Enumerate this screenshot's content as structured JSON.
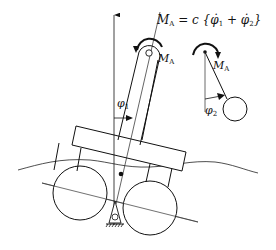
{
  "diagram": {
    "formula": {
      "lhs": "M",
      "lhs_sub": "A",
      "rhs": "= c {φ̇",
      "sub1": "1",
      "plus": " + φ̇",
      "sub2": "2",
      "close": "}"
    },
    "labels": {
      "moment_main": {
        "text": "M",
        "sub": "A"
      },
      "moment_right": {
        "text": "M",
        "sub": "A"
      },
      "phi1": {
        "text": "φ",
        "sub": "1"
      },
      "phi2": {
        "text": "φ",
        "sub": "2"
      }
    },
    "colors": {
      "stroke": "#111111",
      "thin_line": "#333333",
      "background": "#ffffff"
    }
  }
}
